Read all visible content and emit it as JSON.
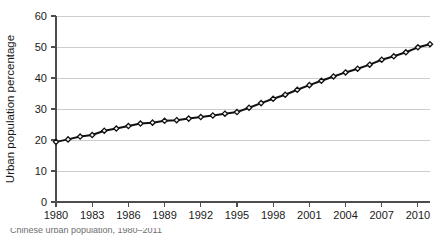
{
  "chart_data": {
    "type": "line",
    "title": "",
    "xlabel": "",
    "ylabel": "Urban population percentage",
    "xlim": [
      1980,
      2011
    ],
    "ylim": [
      0,
      60
    ],
    "grid": true,
    "legend": "none",
    "ytick_labels": [
      "0",
      "10",
      "20",
      "30",
      "40",
      "50",
      "60"
    ],
    "ytick_values": [
      0,
      10,
      20,
      30,
      40,
      50,
      60
    ],
    "xtick_labels": [
      "1980",
      "1983",
      "1986",
      "1989",
      "1992",
      "1995",
      "1998",
      "2001",
      "2004",
      "2007",
      "2010"
    ],
    "xtick_values": [
      1980,
      1983,
      1986,
      1989,
      1992,
      1995,
      1998,
      2001,
      2004,
      2007,
      2010
    ],
    "marker": "diamond",
    "series": [
      {
        "name": "Urban population percentage",
        "color": "#111111",
        "x": [
          1980,
          1981,
          1982,
          1983,
          1984,
          1985,
          1986,
          1987,
          1988,
          1989,
          1990,
          1991,
          1992,
          1993,
          1994,
          1995,
          1996,
          1997,
          1998,
          1999,
          2000,
          2001,
          2002,
          2003,
          2004,
          2005,
          2006,
          2007,
          2008,
          2009,
          2010,
          2011
        ],
        "values": [
          19.4,
          20.2,
          21.1,
          21.6,
          23.0,
          23.7,
          24.5,
          25.3,
          25.6,
          26.2,
          26.4,
          26.9,
          27.4,
          27.9,
          28.5,
          29.0,
          30.4,
          31.9,
          33.3,
          34.6,
          36.2,
          37.7,
          39.1,
          40.5,
          41.8,
          43.0,
          44.3,
          45.9,
          47.0,
          48.3,
          49.9,
          50.9
        ]
      }
    ]
  },
  "caption": {
    "text": "Chinese urban population, 1980–2011"
  }
}
